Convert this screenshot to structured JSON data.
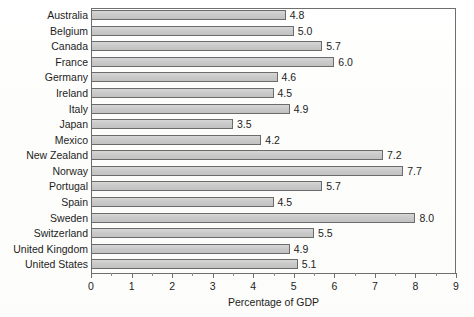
{
  "chart_data": {
    "type": "bar",
    "orientation": "horizontal",
    "title": "",
    "xlabel": "Percentage of GDP",
    "ylabel": "",
    "xlim": [
      0,
      9
    ],
    "xticks": [
      0,
      1,
      2,
      3,
      4,
      5,
      6,
      7,
      8,
      9
    ],
    "xtick_labels": [
      "0",
      "1",
      "2",
      "3",
      "4",
      "5",
      "6",
      "7",
      "8",
      "9"
    ],
    "minor_tick_step": 0.5,
    "grid": false,
    "legend": null,
    "bar_fill_color": "#cacaca",
    "bar_edge_color": "#6b6b6b",
    "axis_color": "#6f6f6f",
    "text_color": "#1d1d1d",
    "value_label_format": "one-decimal",
    "categories": [
      "Australia",
      "Belgium",
      "Canada",
      "France",
      "Germany",
      "Ireland",
      "Italy",
      "Japan",
      "Mexico",
      "New Zealand",
      "Norway",
      "Portugal",
      "Spain",
      "Sweden",
      "Switzerland",
      "United Kingdom",
      "United States"
    ],
    "values": [
      4.8,
      5.0,
      5.7,
      6.0,
      4.6,
      4.5,
      4.9,
      3.5,
      4.2,
      7.2,
      7.7,
      5.7,
      4.5,
      8.0,
      5.5,
      4.9,
      5.1
    ],
    "value_labels": [
      "4.8",
      "5.0",
      "5.7",
      "6.0",
      "4.6",
      "4.5",
      "4.9",
      "3.5",
      "4.2",
      "7.2",
      "7.7",
      "5.7",
      "4.5",
      "8.0",
      "5.5",
      "4.9",
      "5.1"
    ]
  }
}
